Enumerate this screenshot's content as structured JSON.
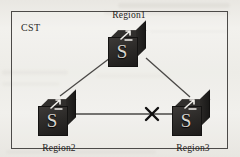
{
  "figure": {
    "frame_label": "CST",
    "background_color": "#efeeea",
    "frame_color": "#4c4a48"
  },
  "nodes": [
    {
      "id": "region1",
      "label": "Region1",
      "icon": "switch-icon",
      "glyph": "S",
      "label_position": "above",
      "x": 129,
      "y": 47
    },
    {
      "id": "region2",
      "label": "Region2",
      "icon": "switch-icon",
      "glyph": "S",
      "label_position": "below",
      "x": 59,
      "y": 116
    },
    {
      "id": "region3",
      "label": "Region3",
      "icon": "switch-icon",
      "glyph": "S",
      "label_position": "below",
      "x": 193,
      "y": 116
    }
  ],
  "links": [
    {
      "id": "link-region1-region2",
      "from": "region1",
      "to": "region2",
      "state": "active",
      "marker": "none"
    },
    {
      "id": "link-region1-region3",
      "from": "region1",
      "to": "region3",
      "state": "active",
      "marker": "none"
    },
    {
      "id": "link-region2-region3",
      "from": "region2",
      "to": "region3",
      "state": "blocked",
      "marker": "x-cross",
      "marker_x": 152,
      "marker_y": 114
    }
  ],
  "colors": {
    "link": "#4a4846",
    "blocked_marker": "#111010",
    "node_body": "#2a2826",
    "node_glyph": "#d9d6d0",
    "text": "#1f1d1c"
  }
}
